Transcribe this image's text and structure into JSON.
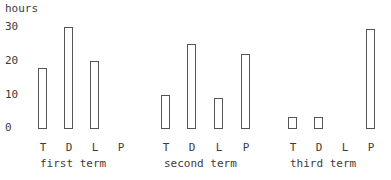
{
  "chart_data": {
    "type": "bar",
    "title": "",
    "xlabel": "",
    "ylabel": "hours",
    "ylim": [
      0,
      30
    ],
    "yticks": [
      "0",
      "10",
      "20",
      "30"
    ],
    "grid": false,
    "legend": null,
    "groups": [
      "first term",
      "second term",
      "third term"
    ],
    "categories": [
      "T",
      "D",
      "L",
      "P"
    ],
    "series": [
      {
        "name": "first term",
        "values": [
          18,
          30,
          20,
          0
        ]
      },
      {
        "name": "second term",
        "values": [
          10,
          25,
          9,
          22
        ]
      },
      {
        "name": "third term",
        "values": [
          3.5,
          3.5,
          0,
          29.5
        ]
      }
    ]
  },
  "labels": {
    "ylabel": "hours",
    "ticks": [
      "30",
      "20",
      "10",
      "0"
    ],
    "terms": [
      "first term",
      "second term",
      "third term"
    ],
    "cats": [
      "T",
      "D",
      "L",
      "P"
    ]
  }
}
